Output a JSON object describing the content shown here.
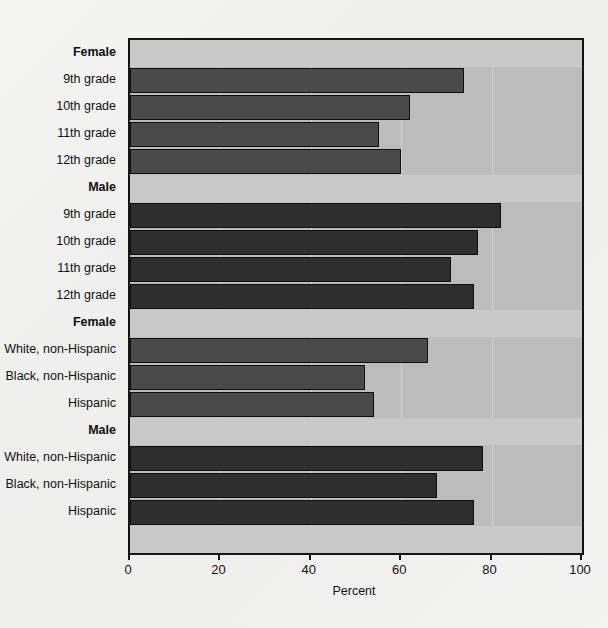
{
  "chart_data": {
    "type": "bar",
    "orientation": "horizontal",
    "title": "",
    "xlabel": "Percent",
    "ylabel": "",
    "xlim": [
      0,
      100
    ],
    "xticks": [
      0,
      20,
      40,
      60,
      80,
      100
    ],
    "xticklabels": [
      "0",
      "20",
      "40",
      "60",
      "80",
      "100"
    ],
    "grid": true,
    "legend": "none",
    "groups": [
      {
        "header": "Female",
        "sex": "female",
        "categories": [
          "9th grade",
          "10th grade",
          "11th grade",
          "12th grade"
        ],
        "values": [
          74,
          62,
          55,
          60
        ]
      },
      {
        "header": "Male",
        "sex": "male",
        "categories": [
          "9th grade",
          "10th grade",
          "11th grade",
          "12th grade"
        ],
        "values": [
          82,
          77,
          71,
          76
        ]
      },
      {
        "header": "Female",
        "sex": "female",
        "categories": [
          "White, non-Hispanic",
          "Black, non-Hispanic",
          "Hispanic"
        ],
        "values": [
          66,
          52,
          54
        ]
      },
      {
        "header": "Male",
        "sex": "male",
        "categories": [
          "White, non-Hispanic",
          "Black, non-Hispanic",
          "Hispanic"
        ],
        "values": [
          78,
          68,
          76
        ]
      }
    ]
  },
  "colors": {
    "page_background": "#f2f2f0",
    "plot_background": "#bcbcbc",
    "header_band": "#c9c9c9",
    "bar_female": "#4a4a4a",
    "bar_male": "#2e2e2e",
    "frame": "#151515",
    "text": "#111111",
    "gridline": "#ffffff"
  }
}
